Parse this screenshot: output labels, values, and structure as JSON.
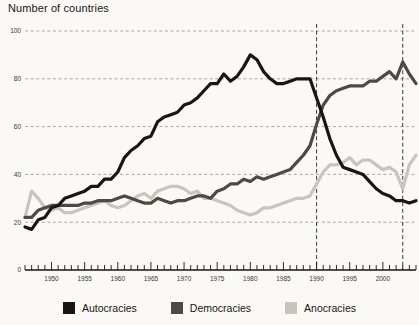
{
  "chart_data": {
    "type": "line",
    "title": "Number of countries",
    "xlabel": "",
    "ylabel": "Number of countries",
    "xlim": [
      1946,
      2005
    ],
    "ylim": [
      0,
      100
    ],
    "grid": true,
    "gridlines_y": [
      20,
      40,
      60,
      80,
      100
    ],
    "y_ticks": [
      0,
      20,
      40,
      60,
      80,
      100
    ],
    "x_ticks": [
      1950,
      1955,
      1960,
      1965,
      1970,
      1975,
      1980,
      1985,
      1990,
      1995,
      2000
    ],
    "x_tick_labels": [
      "1950",
      "1955",
      "1960",
      "1965",
      "1970",
      "1975",
      "1980",
      "1985",
      "1990",
      "1995",
      "2000"
    ],
    "y_tick_labels": [
      "0",
      "20",
      "40",
      "60",
      "80",
      "100"
    ],
    "annotations": [
      {
        "name": "vline-1990",
        "type": "vline",
        "x": 1990,
        "style": "dashed"
      },
      {
        "name": "vline-2003",
        "type": "vline",
        "x": 2003,
        "style": "dashed"
      }
    ],
    "legend_position": "bottom",
    "x": [
      1946,
      1947,
      1948,
      1949,
      1950,
      1951,
      1952,
      1953,
      1954,
      1955,
      1956,
      1957,
      1958,
      1959,
      1960,
      1961,
      1962,
      1963,
      1964,
      1965,
      1966,
      1967,
      1968,
      1969,
      1970,
      1971,
      1972,
      1973,
      1974,
      1975,
      1976,
      1977,
      1978,
      1979,
      1980,
      1981,
      1982,
      1983,
      1984,
      1985,
      1986,
      1987,
      1988,
      1989,
      1990,
      1991,
      1992,
      1993,
      1994,
      1995,
      1996,
      1997,
      1998,
      1999,
      2000,
      2001,
      2002,
      2003,
      2004,
      2005
    ],
    "series": [
      {
        "name": "Autocracies",
        "color": "#1a1512",
        "values": [
          18,
          17,
          21,
          22,
          26,
          27,
          30,
          31,
          32,
          33,
          35,
          35,
          38,
          38,
          41,
          47,
          50,
          52,
          55,
          56,
          62,
          64,
          65,
          66,
          69,
          70,
          72,
          75,
          78,
          78,
          82,
          79,
          81,
          85,
          90,
          88,
          83,
          80,
          78,
          78,
          79,
          80,
          80,
          80,
          72,
          64,
          55,
          48,
          43,
          42,
          41,
          40,
          37,
          34,
          32,
          31,
          29,
          29,
          28,
          29
        ],
        "linewidth": 3.2
      },
      {
        "name": "Democracies",
        "color": "#4d4a45",
        "values": [
          22,
          22,
          25,
          26,
          27,
          27,
          27,
          27,
          27,
          28,
          28,
          29,
          29,
          29,
          30,
          31,
          30,
          29,
          28,
          28,
          30,
          29,
          28,
          29,
          29,
          30,
          31,
          31,
          30,
          33,
          34,
          36,
          36,
          38,
          37,
          39,
          38,
          39,
          40,
          41,
          42,
          45,
          48,
          52,
          61,
          69,
          73,
          75,
          76,
          77,
          77,
          77,
          79,
          79,
          81,
          83,
          80,
          87,
          82,
          78
        ],
        "linewidth": 3.2
      },
      {
        "name": "Anocracies",
        "color": "#c8c5bd",
        "values": [
          22,
          33,
          30,
          26,
          25,
          26,
          24,
          24,
          25,
          26,
          27,
          28,
          29,
          27,
          26,
          27,
          29,
          31,
          32,
          30,
          33,
          34,
          35,
          35,
          34,
          32,
          33,
          30,
          30,
          29,
          28,
          27,
          25,
          24,
          23,
          24,
          26,
          26,
          27,
          28,
          29,
          30,
          30,
          31,
          36,
          41,
          44,
          44,
          45,
          47,
          44,
          46,
          46,
          44,
          42,
          43,
          41,
          34,
          44,
          48
        ],
        "linewidth": 3.2
      }
    ]
  },
  "legend": {
    "items": [
      {
        "label": "Autocracies",
        "color": "#1a1512",
        "swatch": "square-swatch"
      },
      {
        "label": "Democracies",
        "color": "#4d4a45",
        "swatch": "square-swatch"
      },
      {
        "label": "Anocracies",
        "color": "#c8c5bd",
        "swatch": "square-swatch"
      }
    ]
  },
  "colors": {
    "background": "#faf9f6",
    "axis": "#1a1512",
    "grid": "#8a8578",
    "autocracies": "#1a1512",
    "democracies": "#4d4a45",
    "anocracies": "#c8c5bd"
  }
}
